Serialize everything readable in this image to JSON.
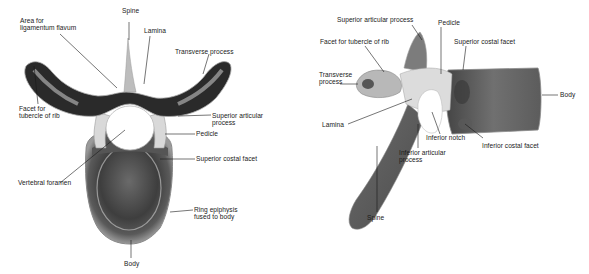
{
  "figure": {
    "views": [
      {
        "id": "superior-view",
        "labels": [
          {
            "key": "spine",
            "text": "Spine",
            "x": 122,
            "y": 14
          },
          {
            "key": "area_lig_flavum",
            "text": "Area for\nligamentum flavum",
            "x": 20,
            "y": 18
          },
          {
            "key": "lamina",
            "text": "Lamina",
            "x": 144,
            "y": 28
          },
          {
            "key": "transverse_process",
            "text": "Transverse process",
            "x": 175,
            "y": 49
          },
          {
            "key": "facet_tubercle_rib",
            "text": "Facet for\ntubercle of rib",
            "x": 19,
            "y": 102
          },
          {
            "key": "superior_articular_process",
            "text": "Superior articular\nprocess",
            "x": 212,
            "y": 113
          },
          {
            "key": "pedicle",
            "text": "Pedicle",
            "x": 196,
            "y": 131
          },
          {
            "key": "superior_costal_facet",
            "text": "Superior costal facet",
            "x": 196,
            "y": 156
          },
          {
            "key": "vertebral_foramen",
            "text": "Vertebral foramen",
            "x": 18,
            "y": 180
          },
          {
            "key": "ring_epiphysis",
            "text": "Ring epiphysis\nfused to body",
            "x": 194,
            "y": 207
          },
          {
            "key": "body",
            "text": "Body",
            "x": 124,
            "y": 259
          }
        ]
      },
      {
        "id": "lateral-view",
        "labels": [
          {
            "key": "superior_articular_process",
            "text": "Superior articular process",
            "x": 337,
            "y": 17
          },
          {
            "key": "pedicle",
            "text": "Pedicle",
            "x": 438,
            "y": 20
          },
          {
            "key": "facet_tubercle_rib",
            "text": "Facet for tubercle of rib",
            "x": 320,
            "y": 38
          },
          {
            "key": "superior_costal_facet",
            "text": "Superior costal facet",
            "x": 454,
            "y": 38
          },
          {
            "key": "transverse_process",
            "text": "Transverse\nprocess",
            "x": 319,
            "y": 71
          },
          {
            "key": "body",
            "text": "Body",
            "x": 560,
            "y": 92
          },
          {
            "key": "lamina",
            "text": "Lamina",
            "x": 322,
            "y": 121
          },
          {
            "key": "inferior_notch",
            "text": "Inferior notch",
            "x": 426,
            "y": 134
          },
          {
            "key": "inferior_costal_facet",
            "text": "Inferior costal facet",
            "x": 482,
            "y": 142
          },
          {
            "key": "inferior_articular_process",
            "text": "Inferior articular\nprocess",
            "x": 399,
            "y": 149
          },
          {
            "key": "spine",
            "text": "Spine",
            "x": 367,
            "y": 214
          }
        ]
      }
    ]
  }
}
